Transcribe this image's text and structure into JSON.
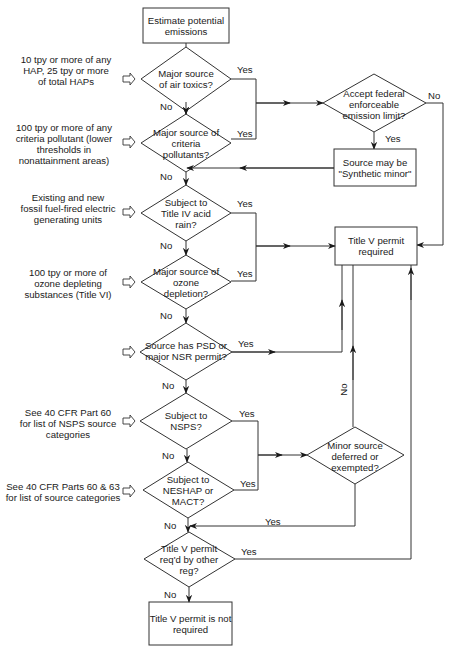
{
  "start": {
    "label": "Estimate potential emissions"
  },
  "decisions": [
    {
      "id": "d1",
      "label": "Major source of air toxics?",
      "note": "10 tpy or more of any HAP, 25 tpy or more of total HAPs",
      "yes": "Yes",
      "no": "No"
    },
    {
      "id": "d2",
      "label": "Major source of criteria pollutants?",
      "note": "100 tpy or more of any criteria pollutant (lower thresholds in nonattainment areas)",
      "yes": "Yes",
      "no": "No"
    },
    {
      "id": "d3",
      "label": "Subject to Title IV acid rain?",
      "note": "Existing and new fossil fuel-fired electric generating units",
      "yes": "Yes",
      "no": "No"
    },
    {
      "id": "d4",
      "label": "Major source of ozone depletion?",
      "note": "100 tpy or more of ozone depleting substances (Title VI)",
      "yes": "Yes",
      "no": "No"
    },
    {
      "id": "d5",
      "label": "Source has PSD or major NSR permit?",
      "note": "",
      "yes": "Yes",
      "no": "No"
    },
    {
      "id": "d6",
      "label": "Subject to NSPS?",
      "note": "See 40 CFR Part 60 for list of NSPS source categories",
      "yes": "Yes",
      "no": "No"
    },
    {
      "id": "d7",
      "label": "Subject to NESHAP or MACT?",
      "note": "See 40 CFR Parts 60 & 63 for list of source categories",
      "yes": "Yes",
      "no": "No"
    },
    {
      "id": "d8",
      "label": "Title V permit req'd by other reg?",
      "note": "",
      "yes": "Yes",
      "no": "No"
    }
  ],
  "side": {
    "accept_limit": {
      "label": "Accept federal enforceable emission limit?",
      "yes": "Yes",
      "no": "No"
    },
    "synthetic_minor": {
      "label": "Source may be \"Synthetic minor\""
    },
    "title_v_required": {
      "label": "Title V permit required"
    },
    "minor_source": {
      "label": "Minor source deferred or exempted?",
      "yes": "Yes",
      "no": "No"
    }
  },
  "end": {
    "label": "Title V permit is not required"
  },
  "colors": {
    "line": "#333333",
    "background": "#ffffff",
    "text": "#1a1a1a"
  }
}
